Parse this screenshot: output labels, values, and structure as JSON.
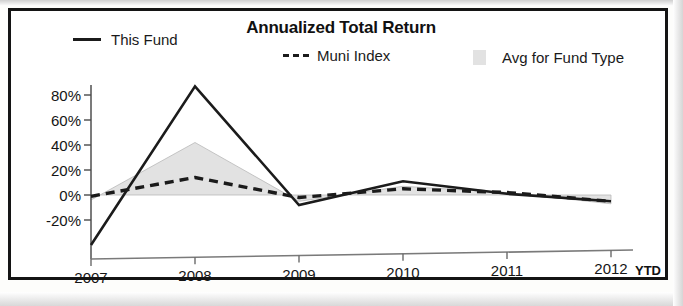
{
  "chart_data": {
    "type": "line",
    "title": "Annualized Total Return",
    "xlabel": "",
    "ylabel": "",
    "categories": [
      "2007",
      "2008",
      "2009",
      "2010",
      "2011",
      "2012"
    ],
    "x_tick_labels": [
      "2007",
      "2008",
      "2009",
      "2010",
      "2011",
      "2012"
    ],
    "x_axis_note": "YTD",
    "y_tick_labels": [
      "80%",
      "60%",
      "40%",
      "20%",
      "0%",
      "-20%"
    ],
    "y_tick_values": [
      80,
      60,
      40,
      20,
      0,
      -20
    ],
    "ylim": [
      -40,
      90
    ],
    "grid": false,
    "legend_position": "top",
    "series": [
      {
        "name": "This Fund",
        "style": "solid",
        "color": "#1b1b1b",
        "values": [
          -40,
          87,
          -8,
          11,
          1,
          -5
        ]
      },
      {
        "name": "Muni Index",
        "style": "dashed",
        "color": "#1b1b1b",
        "values": [
          -1,
          14,
          -2,
          5,
          2,
          -5
        ]
      },
      {
        "name": "Avg for Fund Type",
        "style": "filled-area",
        "color": "#e2e2e2",
        "values": [
          -4,
          42,
          -5,
          7,
          2,
          -7
        ]
      }
    ]
  },
  "legend": {
    "items": [
      {
        "label": "This Fund",
        "marker": "solid-line-swatch"
      },
      {
        "label": "Muni Index",
        "marker": "dashed-line-swatch"
      },
      {
        "label": "Avg for Fund Type",
        "marker": "gray-box-swatch"
      }
    ]
  }
}
